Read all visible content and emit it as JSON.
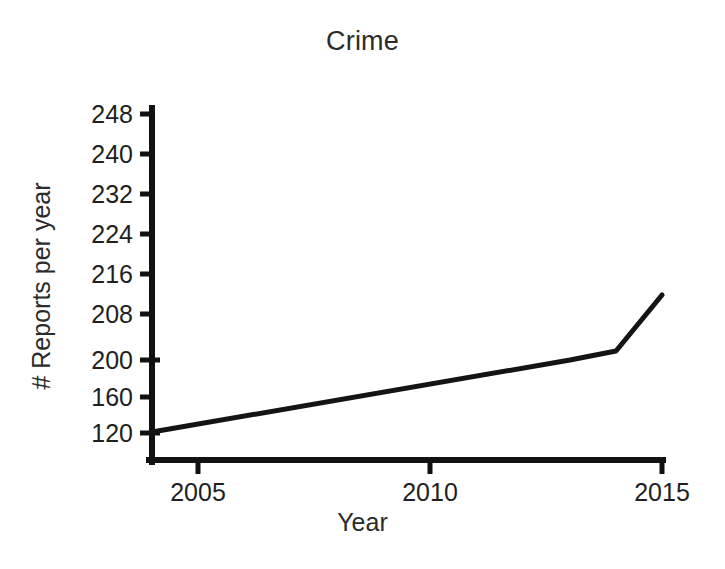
{
  "chart_data": {
    "type": "line",
    "title": "Crime",
    "xlabel": "Year",
    "ylabel": "# Reports per year",
    "grid": false,
    "legend": false,
    "legend_position": "none",
    "line_color": "#141414",
    "line_width_px": 5,
    "x": [
      2004,
      2013,
      2014,
      2015
    ],
    "values": [
      122,
      200,
      202,
      212
    ],
    "series": [
      {
        "name": "Crime reports",
        "x": [
          2004,
          2013,
          2014,
          2015
        ],
        "values": [
          122,
          200,
          202,
          212
        ]
      }
    ],
    "xlim": [
      2004,
      2015
    ],
    "xticks": [
      2005,
      2010,
      2015
    ],
    "xtick_labels": [
      "2005",
      "2010",
      "2015"
    ],
    "ylim": [
      120,
      248
    ],
    "yticks": [
      120,
      160,
      200,
      208,
      216,
      224,
      232,
      240,
      248
    ],
    "ytick_labels": [
      "120",
      "160",
      "200",
      "208",
      "216",
      "224",
      "232",
      "240",
      "248"
    ]
  },
  "axes": {
    "y_ticks_rendered": [
      {
        "label": "248",
        "y_px": 114
      },
      {
        "label": "240",
        "y_px": 154
      },
      {
        "label": "232",
        "y_px": 194
      },
      {
        "label": "224",
        "y_px": 234
      },
      {
        "label": "216",
        "y_px": 274
      },
      {
        "label": "208",
        "y_px": 314
      },
      {
        "label": "200",
        "y_px": 360
      },
      {
        "label": "160",
        "y_px": 397
      },
      {
        "label": "120",
        "y_px": 433
      }
    ],
    "x_ticks_rendered": [
      {
        "label": "2005",
        "x_px": 198
      },
      {
        "label": "2010",
        "x_px": 430
      },
      {
        "label": "2015",
        "x_px": 662
      }
    ],
    "axis_color": "#111111",
    "x_axis_y_px": 460,
    "y_axis_x_px": 152,
    "x_axis_left_px": 152,
    "x_axis_right_px": 663,
    "y_axis_top_px": 108,
    "line_points_px": [
      {
        "x": 152,
        "y": 432
      },
      {
        "x": 570,
        "y": 360
      },
      {
        "x": 616,
        "y": 351
      },
      {
        "x": 662,
        "y": 295
      }
    ]
  }
}
